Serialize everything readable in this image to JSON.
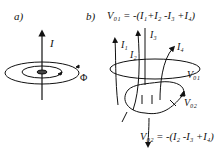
{
  "panel_a": {
    "label": "a)",
    "current_label": "I",
    "loop_label": "Φ"
  },
  "panel_b": {
    "label": "b)",
    "equation_top": "V₀₁ = -(I₁+I₂ -I₃ +I₄)",
    "equation_bottom": "V₀₂ = -(I₂ -I₃ +I₄)",
    "currents": [
      "I₁",
      "I₂",
      "I₃",
      "I₄"
    ],
    "loop_labels": [
      "V₀₁",
      "V₀₂"
    ]
  },
  "colors": {
    "ink": "#111111",
    "background": "#ffffff"
  }
}
